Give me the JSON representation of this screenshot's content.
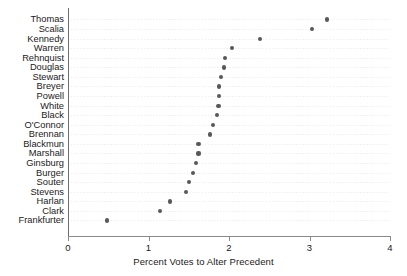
{
  "chart_data": {
    "type": "scatter",
    "title": "",
    "subtitle": "",
    "xlabel": "Percent Votes to Alter Precedent",
    "ylabel": "",
    "xlim": [
      0,
      4
    ],
    "xticks": [
      0,
      1,
      2,
      3,
      4
    ],
    "xtick_labels": [
      "0",
      "1",
      "2",
      "3",
      "4"
    ],
    "grid": "dotted-horizontal-rows",
    "legend": null,
    "marker": "filled-circle",
    "marker_color": "#585858",
    "orientation": "horizontal-dot-plot",
    "categories": [
      "Thomas",
      "Scalia",
      "Kennedy",
      "Warren",
      "Rehnquist",
      "Douglas",
      "Stewart",
      "Breyer",
      "Powell",
      "White",
      "Black",
      "O'Connor",
      "Brennan",
      "Blackmun",
      "Marshall",
      "Ginsburg",
      "Burger",
      "Souter",
      "Stevens",
      "Harlan",
      "Clark",
      "Frankfurter"
    ],
    "values": [
      3.22,
      3.03,
      2.39,
      2.04,
      1.95,
      1.94,
      1.9,
      1.88,
      1.88,
      1.87,
      1.85,
      1.8,
      1.76,
      1.62,
      1.62,
      1.59,
      1.55,
      1.5,
      1.47,
      1.27,
      1.14,
      0.48
    ],
    "points": [
      {
        "label": "Thomas",
        "value": 3.22
      },
      {
        "label": "Scalia",
        "value": 3.03
      },
      {
        "label": "Kennedy",
        "value": 2.39
      },
      {
        "label": "Warren",
        "value": 2.04
      },
      {
        "label": "Rehnquist",
        "value": 1.95
      },
      {
        "label": "Douglas",
        "value": 1.94
      },
      {
        "label": "Stewart",
        "value": 1.9
      },
      {
        "label": "Breyer",
        "value": 1.88
      },
      {
        "label": "Powell",
        "value": 1.88
      },
      {
        "label": "White",
        "value": 1.87
      },
      {
        "label": "Black",
        "value": 1.85
      },
      {
        "label": "O'Connor",
        "value": 1.8
      },
      {
        "label": "Brennan",
        "value": 1.76
      },
      {
        "label": "Blackmun",
        "value": 1.62
      },
      {
        "label": "Marshall",
        "value": 1.62
      },
      {
        "label": "Ginsburg",
        "value": 1.59
      },
      {
        "label": "Burger",
        "value": 1.55
      },
      {
        "label": "Souter",
        "value": 1.5
      },
      {
        "label": "Stevens",
        "value": 1.47
      },
      {
        "label": "Harlan",
        "value": 1.27
      },
      {
        "label": "Clark",
        "value": 1.14
      },
      {
        "label": "Frankfurter",
        "value": 0.48
      }
    ]
  },
  "axis": {
    "x_title": "Percent Votes to Alter Precedent",
    "x_tick_labels": [
      "0",
      "1",
      "2",
      "3",
      "4"
    ]
  },
  "colors": {
    "marker": "#585858",
    "axis": "#8a8a8a",
    "gridline": "#9a9a9a",
    "text": "#1a1a1a",
    "background": "#ffffff"
  }
}
